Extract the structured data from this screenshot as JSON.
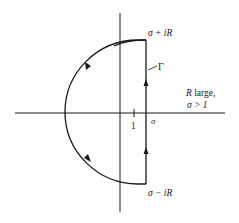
{
  "diagram": {
    "type": "contour-integral-complex-plane",
    "labels": {
      "top_endpoint": "σ + iR",
      "bottom_endpoint": "σ − iR",
      "contour_name": "Γ",
      "condition_line1": "R large,",
      "condition_line2": "σ > 1",
      "tick_one": "1",
      "sigma_axis": "σ"
    },
    "colors": {
      "stroke": "#1a1a1a",
      "background": "#ffffff"
    },
    "geometry": {
      "real_axis": {
        "x1": 15,
        "y": 113,
        "x2": 225
      },
      "imag_axis": {
        "x": 120,
        "y1": 13,
        "y2": 212
      },
      "vertical_segment": {
        "x": 146,
        "y_top": 40,
        "y_bottom": 184
      },
      "arc": {
        "cx": 146,
        "cy": 112,
        "r": 73
      },
      "tick_one_x": 134
    },
    "arrows": [
      {
        "location": "vertical-segment-upper",
        "direction": "up"
      },
      {
        "location": "vertical-segment-lower",
        "direction": "up"
      },
      {
        "location": "arc-upper",
        "direction": "counterclockwise"
      },
      {
        "location": "arc-lower",
        "direction": "counterclockwise"
      }
    ]
  }
}
